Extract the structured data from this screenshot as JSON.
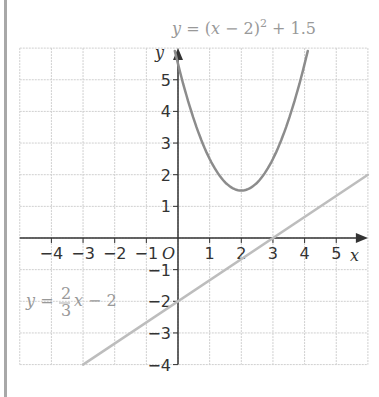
{
  "chart_data": {
    "type": "line",
    "title": "",
    "xlabel": "x",
    "ylabel": "y",
    "xlim": [
      -5,
      6
    ],
    "ylim": [
      -4,
      6
    ],
    "grid": true,
    "origin_label": "O",
    "x_ticks": [
      -4,
      -3,
      -2,
      -1,
      1,
      2,
      3,
      4,
      5
    ],
    "y_ticks": [
      -4,
      -3,
      -2,
      -1,
      1,
      2,
      3,
      4,
      5
    ],
    "series": [
      {
        "name": "y = (x − 2)² + 1.5",
        "equation": "y = (x - 2)^2 + 1.5",
        "kind": "parabola",
        "vertex": [
          2,
          1.5
        ],
        "x_range": [
          -0.1,
          4.1
        ],
        "color": "#8c8c8c"
      },
      {
        "name": "y = 2/3 x − 2",
        "equation": "y = (2/3)x - 2",
        "kind": "line",
        "slope": 0.6667,
        "intercept": -2,
        "x_range": [
          -3,
          6
        ],
        "points": [
          [
            -3,
            -4
          ],
          [
            0,
            -2
          ],
          [
            3,
            0
          ],
          [
            6,
            2
          ]
        ],
        "color": "#bdbdbd"
      }
    ],
    "annotations": [
      {
        "text": "y = (x − 2)² + 1.5",
        "position": "top, above parabola"
      },
      {
        "text": "y = 2/3 x − 2",
        "position": "left, near y = −2"
      }
    ]
  },
  "labels": {
    "parabola_eq": {
      "y": "y",
      "eq": " = (",
      "x": "x",
      "rest": " − 2)",
      "sup": "2",
      "tail": " + 1.5"
    },
    "line_eq": {
      "y": "y",
      "eq": " = ",
      "num": "2",
      "den": "3",
      "x": "x",
      "tail": " − 2"
    },
    "x_axis": "x",
    "y_axis": "y",
    "origin": "O"
  },
  "caption_partial": "... "
}
